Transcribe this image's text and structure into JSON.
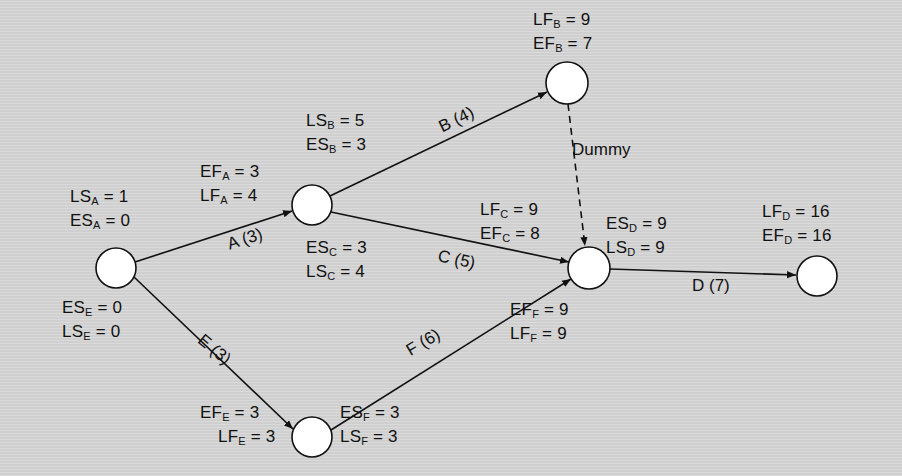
{
  "diagram": {
    "type": "activity-on-arrow network (CPM)",
    "colors": {
      "background": "#d6d6d6",
      "ink": "#111111",
      "node_fill": "#ffffff"
    },
    "nodes": [
      {
        "id": "n1",
        "cx": 116,
        "cy": 268,
        "r": 20
      },
      {
        "id": "n2",
        "cx": 312,
        "cy": 205,
        "r": 20
      },
      {
        "id": "n3",
        "cx": 567,
        "cy": 83,
        "r": 21
      },
      {
        "id": "n4",
        "cx": 589,
        "cy": 268,
        "r": 21
      },
      {
        "id": "n5",
        "cx": 312,
        "cy": 437,
        "r": 20
      },
      {
        "id": "n6",
        "cx": 817,
        "cy": 276,
        "r": 20
      }
    ],
    "activities": [
      {
        "label": "A (3)",
        "from": "n1",
        "to": "n2"
      },
      {
        "label": "B (4)",
        "from": "n2",
        "to": "n3"
      },
      {
        "label": "C (5)",
        "from": "n2",
        "to": "n4"
      },
      {
        "label": "D (7)",
        "from": "n4",
        "to": "n6"
      },
      {
        "label": "E (3)",
        "from": "n1",
        "to": "n5"
      },
      {
        "label": "F (6)",
        "from": "n5",
        "to": "n4"
      },
      {
        "label": "Dummy",
        "from": "n3",
        "to": "n4",
        "dashed": true
      }
    ],
    "labels": {
      "ls_a": {
        "v": "LS",
        "s": "A",
        "t": " = 1"
      },
      "es_a": {
        "v": "ES",
        "s": "A",
        "t": " = 0"
      },
      "es_e": {
        "v": "ES",
        "s": "E",
        "t": " = 0"
      },
      "ls_e": {
        "v": "LS",
        "s": "E",
        "t": " = 0"
      },
      "ef_a": {
        "v": "EF",
        "s": "A",
        "t": " = 3"
      },
      "lf_a": {
        "v": "LF",
        "s": "A",
        "t": " = 4"
      },
      "ls_b": {
        "v": "LS",
        "s": "B",
        "t": " = 5"
      },
      "es_b": {
        "v": "ES",
        "s": "B",
        "t": " = 3"
      },
      "es_c": {
        "v": "ES",
        "s": "C",
        "t": " = 3"
      },
      "ls_c": {
        "v": "LS",
        "s": "C",
        "t": " = 4"
      },
      "lf_b": {
        "v": "LF",
        "s": "B",
        "t": " = 9"
      },
      "ef_b": {
        "v": "EF",
        "s": "B",
        "t": " = 7"
      },
      "lf_c": {
        "v": "LF",
        "s": "C",
        "t": " = 9"
      },
      "ef_c": {
        "v": "EF",
        "s": "C",
        "t": " = 8"
      },
      "es_d": {
        "v": "ES",
        "s": "D",
        "t": " = 9"
      },
      "ls_d": {
        "v": "LS",
        "s": "D",
        "t": " = 9"
      },
      "lf_d": {
        "v": "LF",
        "s": "D",
        "t": " = 16"
      },
      "ef_d": {
        "v": "EF",
        "s": "D",
        "t": " = 16"
      },
      "ef_f": {
        "v": "EF",
        "s": "F",
        "t": " = 9"
      },
      "lf_f": {
        "v": "LF",
        "s": "F",
        "t": " = 9"
      },
      "ef_e": {
        "v": "EF",
        "s": "E",
        "t": " = 3"
      },
      "lf_e": {
        "v": "LF",
        "s": "E",
        "t": " = 3"
      },
      "es_f": {
        "v": "ES",
        "s": "F",
        "t": " = 3"
      },
      "ls_f": {
        "v": "LS",
        "s": "F",
        "t": " = 3"
      }
    },
    "activity_labels": {
      "a": "A (3)",
      "b": "B (4)",
      "c": "C (5)",
      "d": "D (7)",
      "e": "E (3)",
      "f": "F (6)",
      "dummy": "Dummy"
    }
  }
}
